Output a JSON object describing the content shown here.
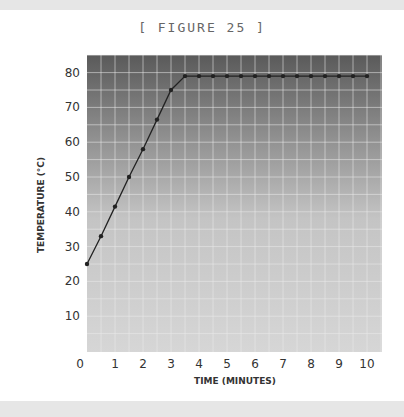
{
  "figure": {
    "title": "[ FIGURE 25 ]"
  },
  "colors": {
    "plot_top": "#5c5c5c",
    "plot_bottom": "#d2d2d2",
    "line": "#222222",
    "grid": "#eeeeee",
    "frame_band": "#e6e6e6"
  },
  "chart_data": {
    "type": "line",
    "title": "[ FIGURE 25 ]",
    "xlabel": "TIME (MINUTES)",
    "ylabel": "TEMPERATURE (°C)",
    "xlim": [
      0,
      10.5
    ],
    "ylim": [
      0,
      85
    ],
    "xticks": [
      0,
      1,
      2,
      3,
      4,
      5,
      6,
      7,
      8,
      9,
      10
    ],
    "yticks": [
      10,
      20,
      30,
      40,
      50,
      60,
      70,
      80
    ],
    "grid": true,
    "legend": null,
    "series": [
      {
        "name": "Temperature",
        "x": [
          0,
          0.5,
          1,
          1.5,
          2,
          2.5,
          3,
          3.5,
          4,
          4.5,
          5,
          5.5,
          6,
          6.5,
          7,
          7.5,
          8,
          8.5,
          9,
          9.5,
          10
        ],
        "y": [
          25,
          33,
          41.5,
          50,
          58,
          66.5,
          75,
          79,
          79,
          79,
          79,
          79,
          79,
          79,
          79,
          79,
          79,
          79,
          79,
          79,
          79
        ]
      }
    ]
  }
}
